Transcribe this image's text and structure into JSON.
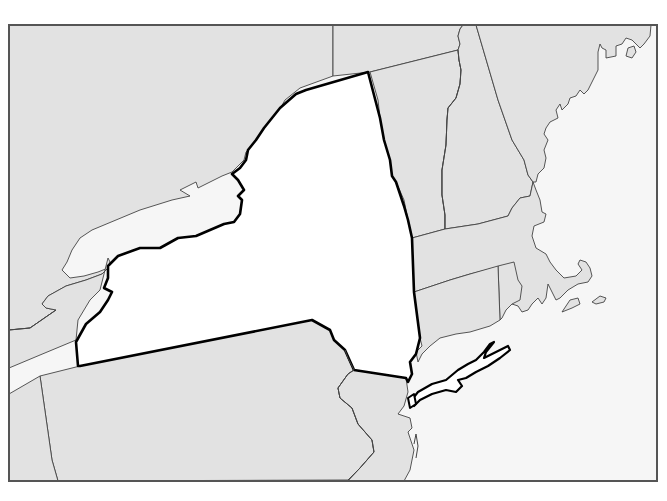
{
  "map": {
    "width": 667,
    "height": 501,
    "frame": {
      "x": 9,
      "y": 25,
      "width": 648,
      "height": 456,
      "stroke": "#555555",
      "stroke_width": 2
    },
    "colors": {
      "land": "#e2e2e2",
      "water": "#f6f6f6",
      "highlight": "#ffffff",
      "border": "#444444",
      "highlight_border": "#000000"
    },
    "highlighted_region": "New York",
    "regions": [
      {
        "id": "water",
        "name": "Lakes and Atlantic Ocean",
        "fill": "#f6f6f6",
        "stroke": "none",
        "d": "M9,25 L657,25 L657,481 L9,481 Z"
      },
      {
        "id": "canada-ontario",
        "name": "Canada (Ontario/Quebec)",
        "fill": "#e2e2e2",
        "stroke": "#444444",
        "width": 0.9,
        "d": "M9,25 L333,25 L333,76 L300,88 L285,100 L275,118 L260,140 L246,152 L244,160 L232,172 L222,176 L198,188 L196,182 L180,190 L190,196 L172,200 L140,210 L116,220 L92,230 L80,238 L72,250 L67,262 L62,270 L70,278 L84,276 L98,272 L108,268 L102,274 L86,280 L66,286 L48,296 L42,304 L46,308 L56,310 L30,328 L9,330 Z"
      },
      {
        "id": "canada-quebec-east",
        "name": "Canada (Quebec)",
        "fill": "#e2e2e2",
        "stroke": "#444444",
        "width": 0.9,
        "d": "M333,25 L463,25 L460,29 L458,36 L460,44 L458,50 L370,72 L333,76 Z"
      },
      {
        "id": "ontario-peninsula",
        "name": "Ontario (south of Lake Ontario west)",
        "fill": "#e2e2e2",
        "stroke": "#444444",
        "width": 0.9,
        "d": "M9,330 L30,328 L56,310 L46,308 L42,304 L48,296 L66,286 L86,280 L102,274 L108,268 L110,262 L108,258 L100,290 L90,300 L78,320 L76,340 L40,355 L9,368 Z"
      },
      {
        "id": "pennsylvania",
        "name": "Pennsylvania",
        "fill": "#e2e2e2",
        "stroke": "#444444",
        "width": 0.9,
        "d": "M40,376 L80,366 L312,320 L330,330 L334,340 L345,350 L348,358 L354,370 L348,374 L338,388 L340,398 L352,408 L358,424 L372,440 L374,452 L360,468 L348,480 L58,481 L52,460 L40,376 Z"
      },
      {
        "id": "pennsylvania-west-strip",
        "name": "Ohio / western Pennsylvania",
        "fill": "#e2e2e2",
        "stroke": "#444444",
        "width": 0.9,
        "d": "M9,394 L40,376 L52,460 L58,481 L9,481 Z"
      },
      {
        "id": "new-jersey",
        "name": "New Jersey",
        "fill": "#e2e2e2",
        "stroke": "#444444",
        "width": 0.9,
        "d": "M354,370 L406,378 L408,392 L404,406 L398,414 L410,418 L412,428 L408,432 L414,450 L410,470 L404,481 L348,481 L360,468 L374,452 L372,440 L358,424 L352,408 L340,398 L338,388 L348,374 Z"
      },
      {
        "id": "vermont",
        "name": "Vermont",
        "fill": "#e2e2e2",
        "stroke": "#444444",
        "width": 0.9,
        "d": "M370,72 L458,50 L459,60 L461,70 L460,84 L456,98 L448,108 L447,120 L446,145 L442,170 L442,195 L445,215 L445,229 L412,238 L408,220 L404,200 L396,182 L392,176 L390,160 L384,140 L380,118 L378,100 Z"
      },
      {
        "id": "new-hampshire",
        "name": "New Hampshire",
        "fill": "#e2e2e2",
        "stroke": "#444444",
        "width": 0.9,
        "d": "M458,50 L460,44 L458,36 L460,29 L463,25 L476,25 L498,100 L512,140 L524,160 L528,175 L533,182 L530,196 L520,198 L512,208 L508,216 L478,224 L445,229 L445,215 L442,195 L442,170 L446,145 L447,120 L448,108 L456,98 L460,84 L461,70 L459,60 Z"
      },
      {
        "id": "maine",
        "name": "Maine",
        "fill": "#e2e2e2",
        "stroke": "#444444",
        "width": 0.9,
        "d": "M476,25 L651,25 L650,36 L644,44 L640,48 L632,40 L626,38 L622,44 L616,46 L616,56 L606,58 L606,50 L602,48 L600,44 L598,52 L598,70 L592,82 L588,90 L584,94 L580,90 L576,96 L570,98 L568,104 L562,110 L560,104 L556,110 L558,118 L550,122 L546,128 L544,134 L548,140 L544,150 L546,158 L544,168 L538,174 L536,182 L533,182 L528,175 L524,160 L512,140 L498,100 Z"
      },
      {
        "id": "maine-island",
        "name": "Mount Desert Island",
        "fill": "#e2e2e2",
        "stroke": "#444444",
        "width": 0.9,
        "d": "M628,48 L634,46 L636,52 L632,58 L626,56 Z"
      },
      {
        "id": "massachusetts",
        "name": "Massachusetts",
        "fill": "#e2e2e2",
        "stroke": "#444444",
        "width": 0.9,
        "d": "M412,238 L445,229 L478,224 L508,216 L512,208 L520,198 L530,196 L533,182 L536,190 L540,200 L542,212 L546,214 L544,222 L534,226 L532,236 L536,248 L546,254 L550,262 L556,270 L564,278 L576,276 L582,270 L578,264 L580,260 L586,262 L590,268 L592,276 L588,282 L578,284 L568,290 L560,298 L556,300 L552,292 L548,284 L546,298 L542,304 L538,298 L532,304 L528,310 L522,312 L518,306 L512,304 L506,296 L502,266 L470,274 L450,280 L414,292 Z"
      },
      {
        "id": "cape-cod-islands-1",
        "name": "Martha's Vineyard",
        "fill": "#e2e2e2",
        "stroke": "#444444",
        "width": 0.9,
        "d": "M562,312 L570,300 L578,298 L580,304 L572,308 Z"
      },
      {
        "id": "cape-cod-islands-2",
        "name": "Nantucket",
        "fill": "#e2e2e2",
        "stroke": "#444444",
        "width": 0.9,
        "d": "M592,302 L600,296 L606,298 L604,302 L596,304 Z"
      },
      {
        "id": "rhode-island",
        "name": "Rhode Island",
        "fill": "#e2e2e2",
        "stroke": "#444444",
        "width": 0.9,
        "d": "M498,266 L514,262 L518,280 L522,286 L520,300 L512,304 L506,310 L502,318 L500,320 Z"
      },
      {
        "id": "connecticut",
        "name": "Connecticut",
        "fill": "#e2e2e2",
        "stroke": "#444444",
        "width": 0.9,
        "d": "M414,292 L450,280 L470,274 L498,266 L500,320 L490,326 L470,332 L456,334 L440,338 L430,346 L422,354 L418,362 L416,352 L422,346 L420,338 Z"
      },
      {
        "id": "new-york",
        "name": "New York",
        "fill": "#ffffff",
        "stroke": "#000000",
        "width": 2.6,
        "d": "M78,366 L76,342 L86,324 L100,312 L108,300 L112,292 L104,288 L108,278 L108,266 L118,256 L140,248 L160,248 L178,238 L196,236 L210,230 L224,224 L234,222 L240,214 L242,200 L238,196 L244,190 L238,180 L232,174 L240,168 L246,160 L248,150 L256,140 L264,128 L280,108 L296,94 L306,90 L368,72 L380,118 L384,140 L390,160 L392,176 L396,182 L398,188 L404,206 L408,220 L412,238 L414,292 L420,338 L416,354 L410,362 L412,374 L408,382 L406,378 L354,370 L345,350 L334,340 L330,330 L312,320 L80,366 Z"
      },
      {
        "id": "long-island",
        "name": "Long Island",
        "fill": "#ffffff",
        "stroke": "#000000",
        "width": 2.2,
        "d": "M410,402 L418,392 L432,384 L446,380 L458,370 L468,364 L476,360 L484,352 L490,344 L494,342 L486,352 L484,358 L492,354 L500,350 L508,346 L510,350 L500,358 L488,366 L476,372 L466,378 L458,380 L462,386 L456,392 L446,390 L432,394 L420,400 L414,406 Z"
      },
      {
        "id": "staten-island",
        "name": "Staten Island",
        "fill": "#ffffff",
        "stroke": "#000000",
        "width": 2,
        "d": "M408,398 L414,394 L416,404 L410,408 Z"
      }
    ],
    "rivers": [
      {
        "id": "connecticut-river",
        "name": "Connecticut River (VT/NH border)",
        "d": "M458,50 L459,60 L461,70 L460,84 L456,98 L448,108 L447,120 L446,145 L442,170 L442,195 L445,215 L445,229",
        "stroke": "#444444",
        "width": 1
      },
      {
        "id": "delaware-river",
        "name": "Delaware River (PA/NJ border)",
        "d": "M345,350 L348,358 L354,370 L348,374 L338,388 L340,398 L352,408 L358,424 L372,440 L374,452 L360,468 L348,480",
        "stroke": "#444444",
        "width": 1
      },
      {
        "id": "nj-barrier-island",
        "name": "New Jersey barrier island",
        "d": "M414,444 L416,434 L418,446 L416,458",
        "stroke": "#444444",
        "width": 1
      },
      {
        "id": "lake-erie-shore",
        "name": "Lake Erie north shore",
        "d": "M9,330 L30,328 L56,310",
        "stroke": "#444444",
        "width": 1
      }
    ],
    "labels": []
  }
}
